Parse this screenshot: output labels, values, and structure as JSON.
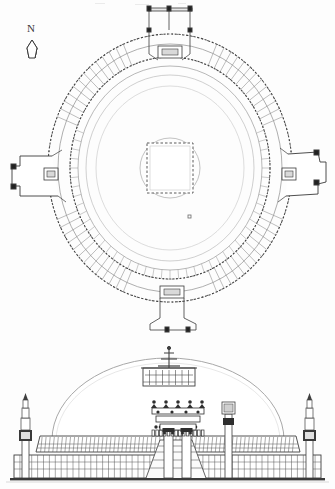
{
  "sheet": {
    "background_color": "#fdfdfd",
    "ink_color": "#2a2a2a",
    "light_ink_color": "#9a9a9a",
    "width": 335,
    "height": 489
  },
  "orientation": {
    "label": "N",
    "icon": "north-arrow-icon",
    "x": 30,
    "y": 30
  },
  "plan": {
    "title": "",
    "center": {
      "x": 170,
      "y": 168
    },
    "rings": [
      {
        "name": "outer-railing-ring",
        "rx": 122,
        "ry": 134,
        "dashed": true
      },
      {
        "name": "outer-walkway-ring",
        "rx": 112,
        "ry": 124,
        "dashed": false
      },
      {
        "name": "inner-railing-ring",
        "rx": 100,
        "ry": 111,
        "dashed": true
      },
      {
        "name": "dome-base-ring",
        "rx": 92,
        "ry": 102,
        "dashed": false
      },
      {
        "name": "dome-outline-ring",
        "rx": 84,
        "ry": 93,
        "dashed": false
      },
      {
        "name": "upper-terrace-ring",
        "rx": 74,
        "ry": 82,
        "dashed": false
      },
      {
        "name": "harmika-ring",
        "rx": 30,
        "ry": 30,
        "dashed": false
      }
    ],
    "relic_chamber": {
      "name": "central-relic-chamber",
      "x": 147,
      "y": 143,
      "width": 46,
      "height": 50
    },
    "baluster_count_outer": 96,
    "baluster_count_inner": 72,
    "gateways": [
      {
        "name": "north-gateway",
        "angle_deg": 270,
        "label": ""
      },
      {
        "name": "south-gateway",
        "angle_deg": 90,
        "label": ""
      },
      {
        "name": "east-gateway",
        "angle_deg": 0,
        "label": ""
      },
      {
        "name": "west-gateway",
        "angle_deg": 180,
        "label": ""
      }
    ],
    "survey_marker": {
      "name": "survey-point-marker",
      "x": 189,
      "y": 216
    }
  },
  "elevation": {
    "title": "",
    "ground_line_y": 480,
    "dome": {
      "cx": 168,
      "cy": 440,
      "rx": 116,
      "ry": 80
    },
    "harmika": {
      "x": 143,
      "y": 368,
      "width": 52,
      "height": 18
    },
    "chhatra": {
      "name": "chhatra-finial",
      "tiers": 3,
      "mast_x": 169,
      "top_y": 347
    },
    "drum_railing": {
      "top_y": 436,
      "bottom_y": 452,
      "bay_count": 64
    },
    "ground_railing": {
      "top_y": 455,
      "bottom_y": 478,
      "bay_count": 52
    },
    "torana": {
      "name": "torana-gateway",
      "cx": 176,
      "architrave_count": 3,
      "pillar_count": 2,
      "top_y": 404
    },
    "stair": {
      "name": "entrance-stair",
      "cx": 176,
      "top_y": 440
    },
    "pillars": [
      {
        "name": "pillar-left",
        "x": 25,
        "base_y": 478,
        "top_y": 415,
        "tiers": 5
      },
      {
        "name": "pillar-right",
        "x": 312,
        "base_y": 478,
        "top_y": 415,
        "tiers": 5
      }
    ],
    "mast": {
      "name": "flag-mast",
      "x": 228,
      "base_y": 478,
      "top_y": 402
    }
  }
}
